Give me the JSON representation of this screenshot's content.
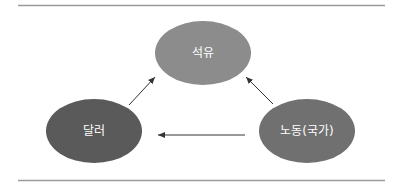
{
  "diagram": {
    "type": "relationship-diagram",
    "nodes": [
      {
        "id": "oil",
        "label": "석유",
        "cx": 203,
        "cy": 53,
        "rx": 48,
        "ry": 32,
        "color": "#8c8c8c"
      },
      {
        "id": "dollar",
        "label": "달러",
        "cx": 94,
        "cy": 131,
        "rx": 48,
        "ry": 32,
        "color": "#5a5a5a"
      },
      {
        "id": "labor",
        "label": "노동(국가)",
        "cx": 307,
        "cy": 131,
        "rx": 48,
        "ry": 32,
        "color": "#707070"
      }
    ],
    "edges": [
      {
        "from": "dollar",
        "to": "oil"
      },
      {
        "from": "labor",
        "to": "oil"
      },
      {
        "from": "labor",
        "to": "dollar"
      }
    ],
    "rule_color": "#9a9a9a",
    "arrow_color": "#333333"
  }
}
